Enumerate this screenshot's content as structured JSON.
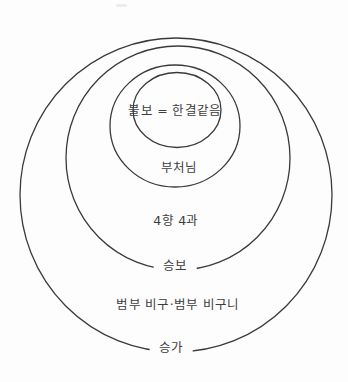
{
  "diagram": {
    "canvas": {
      "width": 348,
      "height": 382,
      "background": "#fdfdfd"
    },
    "style": {
      "line_color": "#3a3a3a",
      "line_width": 1.3,
      "text_color": "#3d3d3d"
    }
  },
  "rings": [
    {
      "name": "sangha-outer-ring",
      "cx": 176,
      "cy": 195,
      "rx": 156,
      "ry": 157
    },
    {
      "name": "seungbo-ring",
      "cx": 178,
      "cy": 158,
      "rx": 112,
      "ry": 112
    },
    {
      "name": "buddha-ring",
      "cx": 175,
      "cy": 126,
      "rx": 65,
      "ry": 61
    },
    {
      "name": "bulbo-inner-circle",
      "cx": 177,
      "cy": 110,
      "rx": 44,
      "ry": 37.5
    }
  ],
  "labels": [
    {
      "name": "bulbo",
      "text": "불보 = 한결같음",
      "x": 175,
      "y": 111,
      "on_line": false
    },
    {
      "name": "buddha",
      "text": "부처님",
      "x": 179,
      "y": 168,
      "on_line": false
    },
    {
      "name": "four-paths",
      "text": "4향 4과",
      "x": 176,
      "y": 221,
      "on_line": false
    },
    {
      "name": "seungbo",
      "text": "승보",
      "x": 175,
      "y": 266,
      "on_line": true
    },
    {
      "name": "ordinary-monks",
      "text": "범부 비구·범부 비구니",
      "x": 178,
      "y": 305,
      "on_line": false
    },
    {
      "name": "sangha",
      "text": "승가",
      "x": 171,
      "y": 348,
      "on_line": true
    }
  ]
}
